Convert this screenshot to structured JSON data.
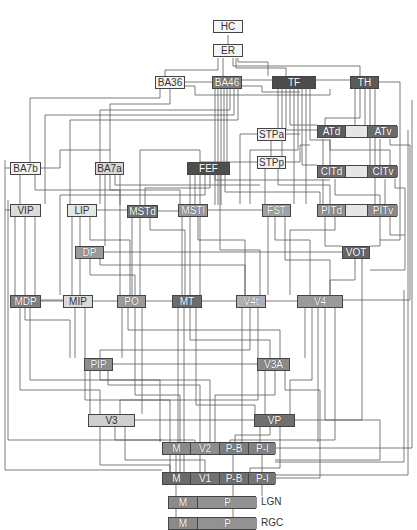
{
  "diagram": {
    "title": "",
    "type": "hierarchy-of-visual-areas",
    "nodes": [
      {
        "id": "HC",
        "label": "HC",
        "x": 213,
        "y": 20,
        "w": 30,
        "fill": "#f6f6f6",
        "light": true
      },
      {
        "id": "ER",
        "label": "ER",
        "x": 213,
        "y": 44,
        "w": 30,
        "fill": "#f6f6f6",
        "light": true
      },
      {
        "id": "BA36",
        "label": "BA36",
        "x": 155,
        "y": 76,
        "w": 30,
        "fill": "#f4f4f4",
        "light": true
      },
      {
        "id": "BA46",
        "label": "BA46",
        "x": 212,
        "y": 76,
        "w": 30,
        "fill": "#7c7c7c",
        "light": false
      },
      {
        "id": "TF",
        "label": "TF",
        "x": 272,
        "y": 76,
        "w": 44,
        "fill": "#4c4c4c",
        "light": false
      },
      {
        "id": "TH",
        "label": "TH",
        "x": 350,
        "y": 76,
        "w": 29,
        "fill": "#5a5a5a",
        "light": false
      },
      {
        "id": "STPa",
        "label": "STPa",
        "x": 257,
        "y": 128,
        "w": 29,
        "fill": "#f0f0f0",
        "light": true
      },
      {
        "id": "ATd",
        "label": "ATd",
        "x": 317,
        "y": 125,
        "w": 28,
        "fill": "#5e5e5e",
        "light": false
      },
      {
        "id": "ATv",
        "label": "ATv",
        "x": 367,
        "y": 125,
        "w": 30,
        "fill": "#6a6a6a",
        "light": false
      },
      {
        "id": "BA7b",
        "label": "BA7b",
        "x": 10,
        "y": 162,
        "w": 31,
        "fill": "#f3f3f3",
        "light": true
      },
      {
        "id": "BA7a",
        "label": "BA7a",
        "x": 95,
        "y": 162,
        "w": 29,
        "fill": "#d8d8d8",
        "light": true
      },
      {
        "id": "FEF",
        "label": "FEF",
        "x": 187,
        "y": 162,
        "w": 43,
        "fill": "#4e4e4e",
        "light": false
      },
      {
        "id": "STPp",
        "label": "STPp",
        "x": 257,
        "y": 156,
        "w": 29,
        "fill": "#f0f0f0",
        "light": true
      },
      {
        "id": "CITd",
        "label": "CITd",
        "x": 317,
        "y": 165,
        "w": 28,
        "fill": "#6e6e6e",
        "light": false
      },
      {
        "id": "CITv",
        "label": "CITv",
        "x": 367,
        "y": 165,
        "w": 30,
        "fill": "#6a6a6a",
        "light": false
      },
      {
        "id": "VIP",
        "label": "VIP",
        "x": 10,
        "y": 204,
        "w": 31,
        "fill": "#dcdcdc",
        "light": true
      },
      {
        "id": "LIP",
        "label": "LIP",
        "x": 67,
        "y": 204,
        "w": 30,
        "fill": "#e6e6e6",
        "light": true
      },
      {
        "id": "MSTd",
        "label": "MSTd",
        "x": 127,
        "y": 205,
        "w": 31,
        "fill": "#707070",
        "light": false
      },
      {
        "id": "MSTl",
        "label": "MSTl",
        "x": 178,
        "y": 204,
        "w": 30,
        "fill": "#999999",
        "light": false
      },
      {
        "id": "FST",
        "label": "FST",
        "x": 262,
        "y": 204,
        "w": 29,
        "fill": "#a2a2a2",
        "light": false
      },
      {
        "id": "PITd",
        "label": "PITd",
        "x": 317,
        "y": 204,
        "w": 28,
        "fill": "#909090",
        "light": false
      },
      {
        "id": "PITv",
        "label": "PITv",
        "x": 367,
        "y": 204,
        "w": 30,
        "fill": "#8a8a8a",
        "light": false
      },
      {
        "id": "DP",
        "label": "DP",
        "x": 75,
        "y": 246,
        "w": 29,
        "fill": "#9a9a9a",
        "light": false
      },
      {
        "id": "VOT",
        "label": "VOT",
        "x": 342,
        "y": 246,
        "w": 28,
        "fill": "#666666",
        "light": false
      },
      {
        "id": "MDP",
        "label": "MDP",
        "x": 10,
        "y": 295,
        "w": 31,
        "fill": "#808080",
        "light": false
      },
      {
        "id": "MIP",
        "label": "MIP",
        "x": 63,
        "y": 295,
        "w": 30,
        "fill": "#dadada",
        "light": true
      },
      {
        "id": "PO",
        "label": "PO",
        "x": 117,
        "y": 295,
        "w": 29,
        "fill": "#9a9a9a",
        "light": false
      },
      {
        "id": "MT",
        "label": "MT",
        "x": 172,
        "y": 295,
        "w": 30,
        "fill": "#6c6c6c",
        "light": false
      },
      {
        "id": "V4t",
        "label": "V4t",
        "x": 236,
        "y": 295,
        "w": 30,
        "fill": "#b0b0b0",
        "light": false
      },
      {
        "id": "V4",
        "label": "V4",
        "x": 297,
        "y": 295,
        "w": 46,
        "fill": "#9a9a9a",
        "light": false
      },
      {
        "id": "PIP",
        "label": "PIP",
        "x": 84,
        "y": 358,
        "w": 29,
        "fill": "#8e8e8e",
        "light": false
      },
      {
        "id": "V3A",
        "label": "V3A",
        "x": 257,
        "y": 358,
        "w": 33,
        "fill": "#8a8a8a",
        "light": false
      },
      {
        "id": "V3",
        "label": "V3",
        "x": 88,
        "y": 414,
        "w": 47,
        "fill": "#cfcfcf",
        "light": true
      },
      {
        "id": "VP",
        "label": "VP",
        "x": 254,
        "y": 414,
        "w": 41,
        "fill": "#707070",
        "light": false
      }
    ],
    "compound_nodes": [
      {
        "id": "ATcomplex",
        "x": 317,
        "y": 125,
        "w": 80,
        "segments": [
          {
            "label": "ATd",
            "w": 28,
            "fill": "#5e5e5e"
          },
          {
            "label": "",
            "w": 22,
            "fill": "#e6e6e6"
          },
          {
            "label": "ATv",
            "w": 30,
            "fill": "#6a6a6a"
          }
        ]
      },
      {
        "id": "CITcomplex",
        "x": 317,
        "y": 165,
        "w": 80,
        "segments": [
          {
            "label": "CITd",
            "w": 28,
            "fill": "#6e6e6e"
          },
          {
            "label": "",
            "w": 22,
            "fill": "#e6e6e6"
          },
          {
            "label": "CITv",
            "w": 30,
            "fill": "#6a6a6a"
          }
        ]
      },
      {
        "id": "PITcomplex",
        "x": 317,
        "y": 204,
        "w": 80,
        "segments": [
          {
            "label": "PITd",
            "w": 28,
            "fill": "#909090"
          },
          {
            "label": "",
            "w": 22,
            "fill": "#e6e6e6"
          },
          {
            "label": "PITv",
            "w": 30,
            "fill": "#8a8a8a"
          }
        ]
      },
      {
        "id": "V2",
        "x": 162,
        "y": 442,
        "w": 113,
        "segments": [
          {
            "label": "M",
            "w": 28,
            "fill": "#8a8a8a"
          },
          {
            "label": "V2",
            "w": 29,
            "fill": "#8e8e8e"
          },
          {
            "label": "P-B",
            "w": 29,
            "fill": "#7e7e7e"
          },
          {
            "label": "P-I",
            "w": 27,
            "fill": "#828282"
          }
        ]
      },
      {
        "id": "V1",
        "x": 162,
        "y": 472,
        "w": 113,
        "segments": [
          {
            "label": "M",
            "w": 28,
            "fill": "#6a6a6a"
          },
          {
            "label": "V1",
            "w": 29,
            "fill": "#727272"
          },
          {
            "label": "P-B",
            "w": 29,
            "fill": "#6e6e6e"
          },
          {
            "label": "P-I",
            "w": 27,
            "fill": "#767676"
          }
        ]
      },
      {
        "id": "LGN",
        "x": 168,
        "y": 496,
        "w": 88,
        "side_label": "LGN",
        "segments": [
          {
            "label": "M",
            "w": 29,
            "fill": "#8a8a8a"
          },
          {
            "label": "P",
            "w": 59,
            "fill": "#929292"
          }
        ]
      },
      {
        "id": "RGC",
        "x": 168,
        "y": 517,
        "w": 88,
        "side_label": "RGC",
        "segments": [
          {
            "label": "M",
            "w": 29,
            "fill": "#8a8a8a"
          },
          {
            "label": "P",
            "w": 59,
            "fill": "#929292"
          }
        ]
      }
    ],
    "side_labels": {
      "lgn": "LGN",
      "rgc": "RGC"
    },
    "wire_color": "#5a5a5a"
  }
}
